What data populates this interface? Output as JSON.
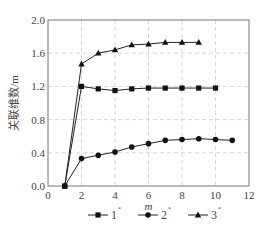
{
  "chart_data": {
    "type": "line",
    "title": "",
    "xlabel": "m",
    "ylabel": "关联维数/m",
    "xlim": [
      0,
      12
    ],
    "ylim": [
      0.0,
      2.0
    ],
    "x_ticks": [
      "0",
      "2",
      "4",
      "6",
      "8",
      "10",
      "12"
    ],
    "y_ticks": [
      "0.0",
      "0.4",
      "0.8",
      "1.2",
      "1.6",
      "2.0"
    ],
    "grid": true,
    "legend_position": "bottom",
    "series": [
      {
        "name": "1",
        "marker": "square",
        "x": [
          1,
          2,
          3,
          4,
          5,
          6,
          7,
          8,
          9,
          10
        ],
        "values": [
          0.0,
          1.2,
          1.17,
          1.15,
          1.17,
          1.18,
          1.18,
          1.18,
          1.18,
          1.18
        ]
      },
      {
        "name": "2",
        "marker": "circle",
        "x": [
          1,
          2,
          3,
          4,
          5,
          6,
          7,
          8,
          9,
          10,
          11
        ],
        "values": [
          0.0,
          0.33,
          0.37,
          0.41,
          0.47,
          0.51,
          0.55,
          0.56,
          0.57,
          0.56,
          0.55
        ]
      },
      {
        "name": "3",
        "marker": "triangle",
        "x": [
          1,
          2,
          3,
          4,
          5,
          6,
          7,
          8,
          9
        ],
        "values": [
          0.0,
          1.47,
          1.6,
          1.64,
          1.7,
          1.71,
          1.73,
          1.73,
          1.73
        ]
      }
    ]
  },
  "legend": {
    "items": [
      {
        "label": "1",
        "sup": "*"
      },
      {
        "label": "2",
        "sup": "*"
      },
      {
        "label": "3",
        "sup": "*"
      }
    ]
  }
}
